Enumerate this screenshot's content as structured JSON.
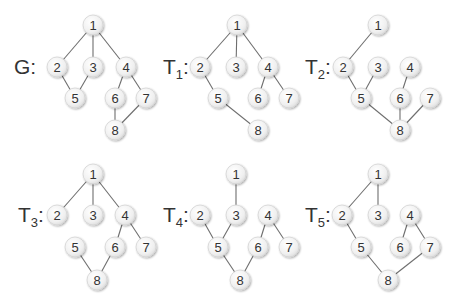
{
  "figure": {
    "node_style": {
      "radius": 10,
      "fill": "#f2f2f2",
      "stroke": "#d4d4d4",
      "edge_color": "#6e6e6e",
      "text_color": "#333333"
    }
  },
  "graphs": [
    {
      "id": "G",
      "label_main": "G",
      "label_sub": "",
      "label_suffix": ":",
      "label_pos": [
        14,
        74
      ],
      "nodes": {
        "1": [
          93,
          25
        ],
        "2": [
          57,
          67
        ],
        "3": [
          93,
          67
        ],
        "4": [
          126,
          67
        ],
        "5": [
          75,
          98
        ],
        "6": [
          115,
          98
        ],
        "7": [
          146,
          98
        ],
        "8": [
          115,
          130
        ]
      },
      "edges": [
        [
          "1",
          "2"
        ],
        [
          "1",
          "3"
        ],
        [
          "1",
          "4"
        ],
        [
          "2",
          "5"
        ],
        [
          "3",
          "5"
        ],
        [
          "4",
          "6"
        ],
        [
          "4",
          "7"
        ],
        [
          "6",
          "8"
        ],
        [
          "7",
          "8"
        ]
      ]
    },
    {
      "id": "T1",
      "label_main": "T",
      "label_sub": "1",
      "label_suffix": ":",
      "label_pos": [
        163,
        74
      ],
      "nodes": {
        "1": [
          237,
          25
        ],
        "2": [
          200,
          67
        ],
        "3": [
          236,
          67
        ],
        "4": [
          268,
          67
        ],
        "5": [
          218,
          98
        ],
        "6": [
          258,
          98
        ],
        "7": [
          289,
          98
        ],
        "8": [
          258,
          130
        ]
      },
      "edges": [
        [
          "1",
          "2"
        ],
        [
          "1",
          "3"
        ],
        [
          "1",
          "4"
        ],
        [
          "2",
          "5"
        ],
        [
          "4",
          "6"
        ],
        [
          "4",
          "7"
        ],
        [
          "5",
          "8"
        ]
      ]
    },
    {
      "id": "T2",
      "label_main": "T",
      "label_sub": "2",
      "label_suffix": ":",
      "label_pos": [
        305,
        74
      ],
      "nodes": {
        "1": [
          378,
          25
        ],
        "2": [
          343,
          67
        ],
        "3": [
          378,
          67
        ],
        "4": [
          410,
          67
        ],
        "5": [
          361,
          98
        ],
        "6": [
          400,
          98
        ],
        "7": [
          430,
          98
        ],
        "8": [
          400,
          130
        ]
      },
      "edges": [
        [
          "1",
          "2"
        ],
        [
          "2",
          "5"
        ],
        [
          "3",
          "5"
        ],
        [
          "4",
          "6"
        ],
        [
          "5",
          "8"
        ],
        [
          "6",
          "8"
        ],
        [
          "7",
          "8"
        ]
      ]
    },
    {
      "id": "T3",
      "label_main": "T",
      "label_sub": "3",
      "label_suffix": ":",
      "label_pos": [
        18,
        222
      ],
      "nodes": {
        "1": [
          93,
          174
        ],
        "2": [
          57,
          215
        ],
        "3": [
          93,
          215
        ],
        "4": [
          125,
          215
        ],
        "5": [
          75,
          247
        ],
        "6": [
          115,
          247
        ],
        "7": [
          146,
          247
        ],
        "8": [
          97,
          280
        ]
      },
      "edges": [
        [
          "1",
          "2"
        ],
        [
          "1",
          "3"
        ],
        [
          "1",
          "4"
        ],
        [
          "4",
          "6"
        ],
        [
          "4",
          "7"
        ],
        [
          "5",
          "8"
        ],
        [
          "6",
          "8"
        ]
      ]
    },
    {
      "id": "T4",
      "label_main": "T",
      "label_sub": "4",
      "label_suffix": ":",
      "label_pos": [
        163,
        222
      ],
      "nodes": {
        "1": [
          236,
          174
        ],
        "2": [
          200,
          215
        ],
        "3": [
          236,
          215
        ],
        "4": [
          268,
          215
        ],
        "5": [
          218,
          247
        ],
        "6": [
          258,
          247
        ],
        "7": [
          289,
          247
        ],
        "8": [
          240,
          280
        ]
      },
      "edges": [
        [
          "1",
          "3"
        ],
        [
          "2",
          "5"
        ],
        [
          "3",
          "5"
        ],
        [
          "4",
          "6"
        ],
        [
          "4",
          "7"
        ],
        [
          "5",
          "8"
        ],
        [
          "6",
          "8"
        ]
      ]
    },
    {
      "id": "T5",
      "label_main": "T",
      "label_sub": "5",
      "label_suffix": ":",
      "label_pos": [
        305,
        222
      ],
      "nodes": {
        "1": [
          378,
          174
        ],
        "2": [
          342,
          215
        ],
        "3": [
          378,
          215
        ],
        "4": [
          410,
          215
        ],
        "5": [
          361,
          247
        ],
        "6": [
          400,
          247
        ],
        "7": [
          430,
          247
        ],
        "8": [
          388,
          280
        ]
      },
      "edges": [
        [
          "1",
          "2"
        ],
        [
          "1",
          "3"
        ],
        [
          "2",
          "5"
        ],
        [
          "4",
          "6"
        ],
        [
          "4",
          "7"
        ],
        [
          "5",
          "8"
        ],
        [
          "7",
          "8"
        ]
      ]
    }
  ]
}
